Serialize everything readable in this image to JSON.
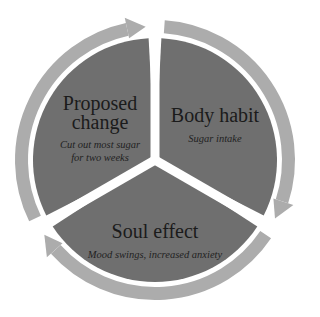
{
  "diagram": {
    "type": "cycle",
    "colors": {
      "segment_fill": "#6f6f6f",
      "ring": "#acacac",
      "separator": "#ffffff",
      "text": "#1e1e1e"
    },
    "segments": [
      {
        "title": "Proposed change",
        "title_lines": [
          "Proposed",
          "change"
        ],
        "subtitle_lines": [
          "Cut out most sugar",
          "for two weeks"
        ]
      },
      {
        "title": "Body habit",
        "title_lines": [
          "Body habit"
        ],
        "subtitle_lines": [
          "Sugar intake"
        ]
      },
      {
        "title": "Soul effect",
        "title_lines": [
          "Soul effect"
        ],
        "subtitle_lines": [
          "Mood swings, increased anxiety"
        ]
      }
    ]
  }
}
